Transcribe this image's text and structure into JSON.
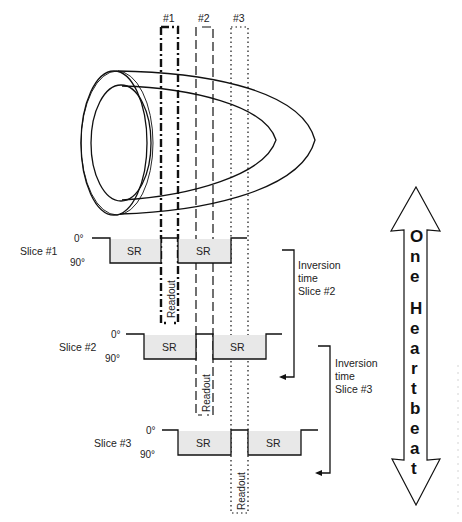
{
  "figure": {
    "slice_labels": [
      "#1",
      "#2",
      "#3"
    ],
    "readout_label": "Readout",
    "rows": [
      {
        "name": "Slice #1",
        "angle_top": "0°",
        "angle_bottom": "90°",
        "sr_left": "SR",
        "sr_right": "SR"
      },
      {
        "name": "Slice #2",
        "angle_top": "0°",
        "angle_bottom": "90°",
        "sr_left": "SR",
        "sr_right": "SR"
      },
      {
        "name": "Slice #3",
        "angle_top": "0°",
        "angle_bottom": "90°",
        "sr_left": "SR",
        "sr_right": "SR"
      }
    ],
    "inversion_annotations": [
      {
        "line1": "Inversion",
        "line2": "time",
        "line3": "Slice #2"
      },
      {
        "line1": "Inversion",
        "line2": "time",
        "line3": "Slice #3"
      }
    ],
    "heartbeat_arrow": {
      "letters": [
        "O",
        "n",
        "e",
        "H",
        "e",
        "a",
        "r",
        "t",
        "b",
        "e",
        "a",
        "t"
      ],
      "text": "One Heartbeat"
    },
    "colors": {
      "line": "#111111",
      "sr_fill": "#e8e8e8",
      "background": "#ffffff"
    }
  }
}
